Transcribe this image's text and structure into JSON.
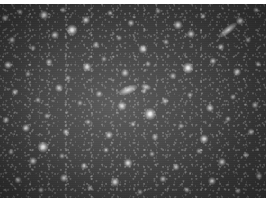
{
  "image": {
    "kind": "astronomical-star-field",
    "title": "Dense star field",
    "description": "Grayscale deep-sky exposure showing a crowded field of resolved stars with soft halos over a mottled, slightly brighter background toward the centre-left, with horizontal CCD scan-line texture.",
    "color_mode": "grayscale",
    "width_px": 276,
    "height_px": 198,
    "frame": {
      "left_px": 0,
      "top_px": 4,
      "width_px": 266,
      "height_px": 194
    },
    "margins": {
      "top_px": 4,
      "right_px": 10,
      "left_px": 0,
      "bottom_px": 0,
      "color": "#ffffff"
    },
    "palette": {
      "page_background": "#ffffff",
      "sky_dark": "#363636",
      "sky_mid": "#464646",
      "sky_bright": "#5c5c5c",
      "star_core": "#ffffff",
      "star_halo": "#dcdcdc"
    },
    "texture": {
      "scanlines": true,
      "scanline_opacity": 0.1,
      "granulation": true,
      "vignette": true
    },
    "stars": [
      {
        "x": 5,
        "y": 14,
        "size": 7,
        "brightness": 0.62
      },
      {
        "x": 20,
        "y": 8,
        "size": 6,
        "brightness": 0.55
      },
      {
        "x": 44,
        "y": 11,
        "size": 9,
        "brightness": 0.78
      },
      {
        "x": 63,
        "y": 6,
        "size": 6,
        "brightness": 0.52
      },
      {
        "x": 86,
        "y": 16,
        "size": 8,
        "brightness": 0.7
      },
      {
        "x": 110,
        "y": 9,
        "size": 6,
        "brightness": 0.5
      },
      {
        "x": 131,
        "y": 19,
        "size": 7,
        "brightness": 0.6
      },
      {
        "x": 158,
        "y": 7,
        "size": 6,
        "brightness": 0.48
      },
      {
        "x": 178,
        "y": 21,
        "size": 9,
        "brightness": 0.74
      },
      {
        "x": 203,
        "y": 12,
        "size": 6,
        "brightness": 0.52
      },
      {
        "x": 240,
        "y": 17,
        "size": 8,
        "brightness": 0.68
      },
      {
        "x": 256,
        "y": 6,
        "size": 6,
        "brightness": 0.5
      },
      {
        "x": 12,
        "y": 36,
        "size": 7,
        "brightness": 0.58
      },
      {
        "x": 33,
        "y": 44,
        "size": 6,
        "brightness": 0.5
      },
      {
        "x": 55,
        "y": 31,
        "size": 8,
        "brightness": 0.66
      },
      {
        "x": 72,
        "y": 26,
        "size": 11,
        "brightness": 0.9
      },
      {
        "x": 96,
        "y": 41,
        "size": 7,
        "brightness": 0.58
      },
      {
        "x": 119,
        "y": 34,
        "size": 6,
        "brightness": 0.48
      },
      {
        "x": 143,
        "y": 45,
        "size": 9,
        "brightness": 0.76
      },
      {
        "x": 166,
        "y": 38,
        "size": 6,
        "brightness": 0.52
      },
      {
        "x": 191,
        "y": 30,
        "size": 8,
        "brightness": 0.7
      },
      {
        "x": 221,
        "y": 43,
        "size": 7,
        "brightness": 0.6
      },
      {
        "x": 248,
        "y": 36,
        "size": 6,
        "brightness": 0.5
      },
      {
        "x": 8,
        "y": 61,
        "size": 8,
        "brightness": 0.68
      },
      {
        "x": 28,
        "y": 70,
        "size": 6,
        "brightness": 0.5
      },
      {
        "x": 49,
        "y": 58,
        "size": 7,
        "brightness": 0.6
      },
      {
        "x": 68,
        "y": 74,
        "size": 6,
        "brightness": 0.5
      },
      {
        "x": 87,
        "y": 63,
        "size": 9,
        "brightness": 0.78
      },
      {
        "x": 104,
        "y": 55,
        "size": 6,
        "brightness": 0.48
      },
      {
        "x": 125,
        "y": 69,
        "size": 8,
        "brightness": 0.68
      },
      {
        "x": 148,
        "y": 60,
        "size": 6,
        "brightness": 0.52
      },
      {
        "x": 173,
        "y": 72,
        "size": 7,
        "brightness": 0.58
      },
      {
        "x": 188,
        "y": 64,
        "size": 11,
        "brightness": 0.92
      },
      {
        "x": 213,
        "y": 57,
        "size": 7,
        "brightness": 0.62
      },
      {
        "x": 237,
        "y": 68,
        "size": 8,
        "brightness": 0.7
      },
      {
        "x": 258,
        "y": 60,
        "size": 6,
        "brightness": 0.5
      },
      {
        "x": 15,
        "y": 88,
        "size": 7,
        "brightness": 0.6
      },
      {
        "x": 38,
        "y": 96,
        "size": 6,
        "brightness": 0.5
      },
      {
        "x": 59,
        "y": 84,
        "size": 8,
        "brightness": 0.68
      },
      {
        "x": 80,
        "y": 99,
        "size": 6,
        "brightness": 0.48
      },
      {
        "x": 99,
        "y": 90,
        "size": 7,
        "brightness": 0.58
      },
      {
        "x": 122,
        "y": 102,
        "size": 9,
        "brightness": 0.8
      },
      {
        "x": 144,
        "y": 87,
        "size": 6,
        "brightness": 0.5
      },
      {
        "x": 165,
        "y": 97,
        "size": 7,
        "brightness": 0.6
      },
      {
        "x": 190,
        "y": 91,
        "size": 6,
        "brightness": 0.52
      },
      {
        "x": 210,
        "y": 104,
        "size": 8,
        "brightness": 0.7
      },
      {
        "x": 233,
        "y": 93,
        "size": 6,
        "brightness": 0.5
      },
      {
        "x": 255,
        "y": 101,
        "size": 7,
        "brightness": 0.58
      },
      {
        "x": 6,
        "y": 116,
        "size": 7,
        "brightness": 0.62
      },
      {
        "x": 26,
        "y": 124,
        "size": 8,
        "brightness": 0.72
      },
      {
        "x": 47,
        "y": 112,
        "size": 6,
        "brightness": 0.5
      },
      {
        "x": 66,
        "y": 128,
        "size": 7,
        "brightness": 0.6
      },
      {
        "x": 88,
        "y": 118,
        "size": 6,
        "brightness": 0.48
      },
      {
        "x": 109,
        "y": 131,
        "size": 8,
        "brightness": 0.68
      },
      {
        "x": 133,
        "y": 120,
        "size": 6,
        "brightness": 0.52
      },
      {
        "x": 155,
        "y": 133,
        "size": 7,
        "brightness": 0.58
      },
      {
        "x": 150,
        "y": 110,
        "size": 12,
        "brightness": 0.95
      },
      {
        "x": 181,
        "y": 122,
        "size": 6,
        "brightness": 0.5
      },
      {
        "x": 204,
        "y": 135,
        "size": 9,
        "brightness": 0.78
      },
      {
        "x": 228,
        "y": 115,
        "size": 6,
        "brightness": 0.5
      },
      {
        "x": 251,
        "y": 128,
        "size": 7,
        "brightness": 0.6
      },
      {
        "x": 11,
        "y": 148,
        "size": 6,
        "brightness": 0.5
      },
      {
        "x": 33,
        "y": 157,
        "size": 8,
        "brightness": 0.7
      },
      {
        "x": 43,
        "y": 143,
        "size": 11,
        "brightness": 0.9
      },
      {
        "x": 62,
        "y": 152,
        "size": 6,
        "brightness": 0.48
      },
      {
        "x": 84,
        "y": 162,
        "size": 7,
        "brightness": 0.6
      },
      {
        "x": 106,
        "y": 146,
        "size": 6,
        "brightness": 0.52
      },
      {
        "x": 128,
        "y": 159,
        "size": 9,
        "brightness": 0.8
      },
      {
        "x": 152,
        "y": 150,
        "size": 6,
        "brightness": 0.5
      },
      {
        "x": 176,
        "y": 163,
        "size": 7,
        "brightness": 0.62
      },
      {
        "x": 199,
        "y": 147,
        "size": 6,
        "brightness": 0.48
      },
      {
        "x": 222,
        "y": 158,
        "size": 8,
        "brightness": 0.68
      },
      {
        "x": 246,
        "y": 151,
        "size": 6,
        "brightness": 0.5
      },
      {
        "x": 18,
        "y": 176,
        "size": 7,
        "brightness": 0.58
      },
      {
        "x": 41,
        "y": 186,
        "size": 6,
        "brightness": 0.48
      },
      {
        "x": 64,
        "y": 174,
        "size": 8,
        "brightness": 0.66
      },
      {
        "x": 90,
        "y": 184,
        "size": 6,
        "brightness": 0.5
      },
      {
        "x": 115,
        "y": 178,
        "size": 9,
        "brightness": 0.76
      },
      {
        "x": 140,
        "y": 188,
        "size": 6,
        "brightness": 0.48
      },
      {
        "x": 163,
        "y": 175,
        "size": 7,
        "brightness": 0.58
      },
      {
        "x": 187,
        "y": 186,
        "size": 6,
        "brightness": 0.5
      },
      {
        "x": 212,
        "y": 177,
        "size": 8,
        "brightness": 0.68
      },
      {
        "x": 238,
        "y": 187,
        "size": 6,
        "brightness": 0.48
      },
      {
        "x": 259,
        "y": 172,
        "size": 7,
        "brightness": 0.58
      }
    ],
    "streaks": [
      {
        "x": 228,
        "y": 26,
        "length": 22,
        "thickness": 7,
        "angle": -38,
        "brightness": 0.82,
        "label": "elongated-source-upper-right"
      },
      {
        "x": 128,
        "y": 86,
        "length": 20,
        "thickness": 8,
        "angle": -22,
        "brightness": 0.88,
        "label": "elongated-source-centre"
      },
      {
        "x": 146,
        "y": 83,
        "length": 10,
        "thickness": 6,
        "angle": 15,
        "brightness": 0.72,
        "label": "companion-source-centre"
      }
    ]
  }
}
